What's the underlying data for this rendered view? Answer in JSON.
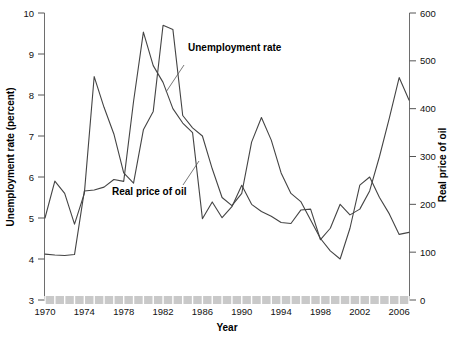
{
  "chart_data": {
    "type": "line",
    "title": "",
    "xlabel": "Year",
    "ylabel": "Unemployment rate (percent)",
    "y2label": "Real price of oil",
    "ylim": [
      3,
      10
    ],
    "y2lim": [
      0,
      600
    ],
    "xlim": [
      1970,
      2007
    ],
    "grid": false,
    "legend_position": "inline-annotations",
    "x_ticks": [
      1970,
      1974,
      1978,
      1982,
      1986,
      1990,
      1994,
      1998,
      2002,
      2006
    ],
    "x_tick_labels": [
      "1970",
      "1974",
      "1978",
      "1982",
      "1986",
      "1990",
      "1994",
      "1998",
      "2002",
      "2006"
    ],
    "y_ticks": [
      3,
      4,
      5,
      6,
      7,
      8,
      9,
      10
    ],
    "y_tick_labels": [
      "3",
      "4",
      "5",
      "6",
      "7",
      "8",
      "9",
      "10"
    ],
    "y2_ticks": [
      0,
      100,
      200,
      300,
      400,
      500,
      600
    ],
    "y2_tick_labels": [
      "0",
      "100",
      "200",
      "300",
      "400",
      "500",
      "600"
    ],
    "x": [
      1970,
      1971,
      1972,
      1973,
      1974,
      1975,
      1976,
      1977,
      1978,
      1979,
      1980,
      1981,
      1982,
      1983,
      1984,
      1985,
      1986,
      1987,
      1988,
      1989,
      1990,
      1991,
      1992,
      1993,
      1994,
      1995,
      1996,
      1997,
      1998,
      1999,
      2000,
      2001,
      2002,
      2003,
      2004,
      2005,
      2006,
      2007
    ],
    "series": [
      {
        "name": "Unemployment rate",
        "axis": "left",
        "units": "percent",
        "values": [
          5.0,
          5.9,
          5.6,
          4.85,
          5.6,
          8.45,
          7.7,
          7.05,
          6.1,
          5.85,
          7.15,
          7.6,
          9.7,
          9.6,
          7.5,
          7.2,
          7.0,
          6.2,
          5.5,
          5.3,
          5.6,
          6.85,
          7.45,
          6.9,
          6.1,
          5.6,
          5.4,
          4.95,
          4.5,
          4.2,
          4.0,
          4.75,
          5.8,
          6.0,
          5.5,
          5.1,
          4.6,
          4.65
        ]
      },
      {
        "name": "Real price of oil",
        "axis": "right",
        "units": "index",
        "values": [
          96,
          94,
          93,
          95,
          228,
          230,
          236,
          252,
          248,
          415,
          560,
          490,
          455,
          400,
          370,
          350,
          170,
          205,
          172,
          195,
          240,
          200,
          185,
          175,
          162,
          160,
          188,
          190,
          126,
          150,
          200,
          178,
          190,
          228,
          300,
          380,
          465,
          418
        ]
      }
    ],
    "annotations": [
      {
        "label": "Unemployment rate",
        "points_to": 1983
      },
      {
        "label": "Real price of oil",
        "points_to": 1985
      }
    ]
  },
  "labels": {
    "y_axis_title": "Unemployment rate (percent)",
    "y2_axis_title": "Real price of oil",
    "x_axis_title": "Year",
    "series_unemployment": "Unemployment rate",
    "series_oil": "Real price of oil"
  },
  "colors": {
    "line": "#444444",
    "axis": "#6e6e6e",
    "band": "#c9c9c9",
    "text": "#111111",
    "background": "#ffffff"
  }
}
